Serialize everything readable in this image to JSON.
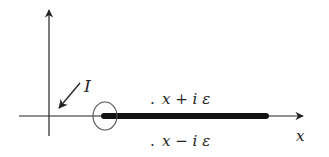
{
  "diagram": {
    "type": "complex-plane-contour",
    "axes": {
      "horizontal_label": "x",
      "vertical_label": ""
    },
    "labels": {
      "contour": "I",
      "upper_dot": ".",
      "upper_expr": "x + i ε",
      "lower_dot": ".",
      "lower_expr": "x − i ε",
      "x_axis": "x"
    },
    "elements": [
      {
        "name": "vertical-axis",
        "description": "vertical axis with arrow at top"
      },
      {
        "name": "horizontal-axis",
        "description": "horizontal real axis with arrow at right"
      },
      {
        "name": "branch-cut",
        "description": "thick bar along real axis from circle to right"
      },
      {
        "name": "small-circle",
        "description": "circle around start of branch cut"
      },
      {
        "name": "contour-arrow",
        "description": "arrow labeled I pointing toward origin"
      }
    ],
    "colors": {
      "stroke": "#222222",
      "circle": "#555555",
      "background": "#ffffff"
    }
  }
}
